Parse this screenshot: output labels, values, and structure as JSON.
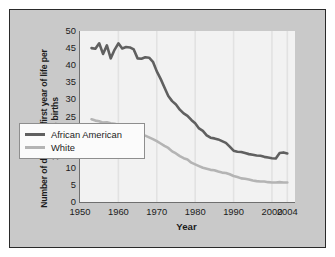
{
  "chart_data": {
    "type": "line",
    "title": "",
    "xlabel": "Year",
    "ylabel": "Number of deaths in first year of life per 1,000 live births",
    "xlim": [
      1950,
      2006
    ],
    "ylim": [
      0,
      50
    ],
    "xticks": [
      "1950",
      "1960",
      "1970",
      "1980",
      "1990",
      "2000",
      "2004"
    ],
    "xtick_values": [
      1950,
      1960,
      1970,
      1980,
      1990,
      2000,
      2004
    ],
    "yticks": [
      "0",
      "5",
      "10",
      "15",
      "20",
      "25",
      "30",
      "35",
      "40",
      "45",
      "50"
    ],
    "ytick_values": [
      0,
      5,
      10,
      15,
      20,
      25,
      30,
      35,
      40,
      45,
      50
    ],
    "grid": "vertical-gridlines-at-decades",
    "legend_position": "lower-left-inside",
    "colors": {
      "african_american": "#606060",
      "white": "#b4b4b4",
      "plot_background": "#f2f2f2",
      "panel_background": "#c9c9c9",
      "axis": "#6f6f6f",
      "text": "#1b1b1b"
    },
    "series": [
      {
        "name": "African American",
        "color": "#606060",
        "x": [
          1953,
          1954,
          1955,
          1956,
          1957,
          1958,
          1959,
          1960,
          1961,
          1962,
          1963,
          1964,
          1965,
          1966,
          1967,
          1968,
          1969,
          1970,
          1971,
          1972,
          1973,
          1974,
          1975,
          1976,
          1977,
          1978,
          1979,
          1980,
          1981,
          1982,
          1983,
          1984,
          1985,
          1986,
          1987,
          1988,
          1989,
          1990,
          1991,
          1992,
          1993,
          1994,
          1995,
          1996,
          1997,
          1998,
          1999,
          2000,
          2001,
          2002,
          2003,
          2004
        ],
        "values": [
          45.0,
          44.8,
          46.4,
          43.3,
          45.8,
          42.0,
          44.5,
          46.4,
          44.9,
          45.3,
          45.2,
          44.6,
          42.0,
          41.9,
          42.3,
          42.2,
          41.0,
          38.2,
          36.0,
          33.5,
          31.0,
          29.5,
          28.5,
          27.0,
          25.9,
          25.2,
          24.0,
          23.0,
          21.5,
          20.8,
          19.5,
          18.8,
          18.6,
          18.3,
          17.8,
          17.3,
          16.2,
          15.0,
          14.7,
          14.6,
          14.3,
          14.0,
          13.8,
          13.6,
          13.5,
          13.2,
          13.0,
          12.8,
          12.7,
          14.3,
          14.5,
          14.2
        ]
      },
      {
        "name": "White",
        "color": "#b4b4b4",
        "x": [
          1953,
          1954,
          1955,
          1956,
          1957,
          1958,
          1959,
          1960,
          1961,
          1962,
          1963,
          1964,
          1965,
          1966,
          1967,
          1968,
          1969,
          1970,
          1971,
          1972,
          1973,
          1974,
          1975,
          1976,
          1977,
          1978,
          1979,
          1980,
          1981,
          1982,
          1983,
          1984,
          1985,
          1986,
          1987,
          1988,
          1989,
          1990,
          1991,
          1992,
          1993,
          1994,
          1995,
          1996,
          1997,
          1998,
          1999,
          2000,
          2001,
          2002,
          2003,
          2004
        ],
        "values": [
          24.2,
          23.8,
          23.6,
          23.2,
          23.3,
          23.0,
          22.9,
          22.6,
          22.2,
          22.0,
          21.4,
          20.7,
          20.0,
          19.7,
          19.4,
          18.9,
          18.4,
          17.8,
          17.1,
          16.4,
          15.8,
          14.8,
          14.2,
          13.4,
          12.8,
          12.4,
          11.5,
          11.0,
          10.5,
          10.0,
          9.7,
          9.4,
          9.3,
          8.9,
          8.6,
          8.5,
          8.1,
          7.6,
          7.3,
          6.9,
          6.8,
          6.6,
          6.3,
          6.1,
          6.0,
          6.0,
          5.8,
          5.7,
          5.7,
          5.8,
          5.7,
          5.7
        ]
      }
    ]
  },
  "legend": {
    "items": [
      {
        "label": "African American",
        "color": "#606060"
      },
      {
        "label": "White",
        "color": "#b4b4b4"
      }
    ]
  }
}
